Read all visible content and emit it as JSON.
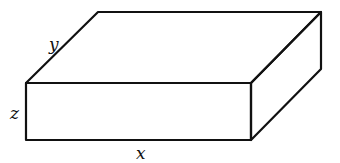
{
  "diagram": {
    "type": "rectangular-box",
    "line_color": "#111111",
    "background": "#ffffff",
    "labels": {
      "length": "x",
      "depth": "y",
      "height": "z"
    },
    "label_positions": {
      "x": [
        141,
        158
      ],
      "y": [
        51,
        48
      ],
      "z": [
        11,
        119
      ]
    },
    "vertices": {
      "front_top_left": [
        26,
        83
      ],
      "front_top_right": [
        251,
        83
      ],
      "front_bottom_left": [
        26,
        140
      ],
      "front_bottom_right": [
        251,
        140
      ],
      "back_top_left": [
        98,
        12
      ],
      "back_top_right": [
        321,
        12
      ],
      "back_bottom_right": [
        321,
        69
      ]
    }
  }
}
